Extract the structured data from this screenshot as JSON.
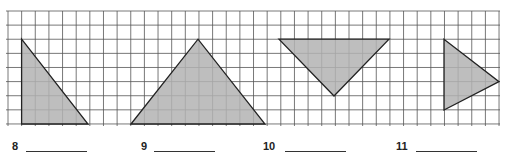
{
  "worksheet": {
    "grid": {
      "x_start": 8,
      "x_end": 499,
      "dx": 13.64,
      "y_start": 11,
      "y_end": 124,
      "dy": 14.12,
      "line_color": "#555555",
      "fill_color": "#b3b3b3",
      "stroke_color": "#222222"
    },
    "problems": [
      {
        "number": "8",
        "shape": "right-triangle",
        "points": "21.6,39.2 21.6,124 88,124",
        "label_x": 12,
        "line_x": 26,
        "line_w": 61
      },
      {
        "number": "9",
        "shape": "isosceles-triangle",
        "points": "131,124 198,39.2 265,124",
        "label_x": 141,
        "line_x": 154,
        "line_w": 61
      },
      {
        "number": "10",
        "shape": "inverted-triangle",
        "points": "279,39.2 389,39.2 334,96",
        "label_x": 263,
        "line_x": 285,
        "line_w": 61
      },
      {
        "number": "11",
        "shape": "arrow-triangle",
        "points": "444,39.2 444,110 499,81.7",
        "label_x": 396,
        "line_x": 416,
        "line_w": 61
      }
    ]
  }
}
